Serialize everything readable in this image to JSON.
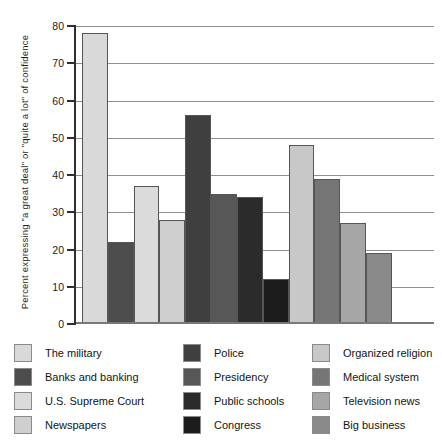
{
  "chart_data": {
    "type": "bar",
    "title": "",
    "ylabel": "Percent expressing \"a great deal\" or \"quite a lot\" of confidence",
    "xlabel": "",
    "ylim": [
      0,
      80
    ],
    "ytick_step": 10,
    "yticks": [
      0,
      10,
      20,
      30,
      40,
      50,
      60,
      70,
      80
    ],
    "grid": true,
    "legend_position": "bottom",
    "categories": [
      "The military",
      "Banks and banking",
      "U.S. Supreme Court",
      "Newspapers",
      "Police",
      "Presidency",
      "Public schools",
      "Congress",
      "Organized religion",
      "Medical system",
      "Television news",
      "Big business"
    ],
    "values": [
      78,
      22,
      37,
      28,
      56,
      35,
      34,
      12,
      48,
      39,
      27,
      19
    ],
    "bar_colors": [
      "#d9d9d9",
      "#4d4d4d",
      "#dbdbdb",
      "#cfcfcf",
      "#3f3f3f",
      "#575757",
      "#2b2b2b",
      "#1c1c1c",
      "#c8c8c8",
      "#767676",
      "#a6a6a6",
      "#8a8a8a"
    ],
    "bar_border_color": "#565656",
    "gridline_color": "#8f8f8f",
    "axis_color": "#2e2e2e"
  }
}
